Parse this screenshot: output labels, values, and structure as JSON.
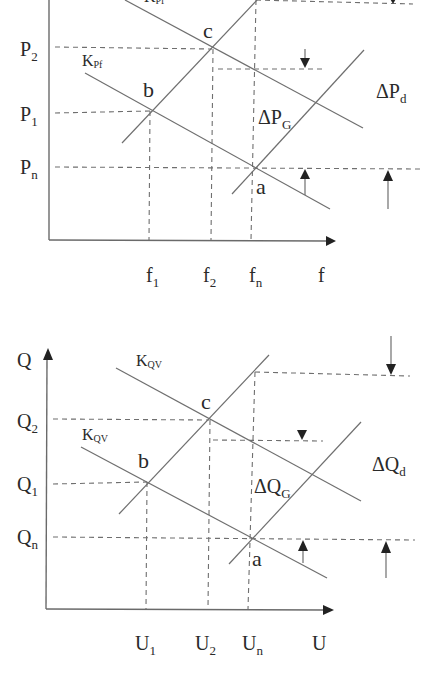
{
  "diagrams": [
    {
      "id": "frequency-power",
      "y_axis": {
        "symbol": "P",
        "ticks": [
          {
            "base": "P",
            "sub": "2"
          },
          {
            "base": "P",
            "sub": "1"
          },
          {
            "base": "P",
            "sub": "n"
          }
        ]
      },
      "x_axis": {
        "symbol": "f",
        "ticks": [
          {
            "base": "f",
            "sub": "1"
          },
          {
            "base": "f",
            "sub": "2"
          },
          {
            "base": "f",
            "sub": "n"
          }
        ]
      },
      "curve_labels": [
        {
          "base": "K",
          "sub": "Pf"
        },
        {
          "base": "K",
          "sub": "Pf"
        }
      ],
      "points": [
        "a",
        "b",
        "c"
      ],
      "delta_labels": [
        {
          "base": "ΔP",
          "sub": "G"
        },
        {
          "base": "ΔP",
          "sub": "d"
        }
      ]
    },
    {
      "id": "voltage-reactive",
      "y_axis": {
        "symbol": "Q",
        "ticks": [
          {
            "base": "Q",
            "sub": "2"
          },
          {
            "base": "Q",
            "sub": "1"
          },
          {
            "base": "Q",
            "sub": "n"
          }
        ]
      },
      "x_axis": {
        "symbol": "U",
        "ticks": [
          {
            "base": "U",
            "sub": "1"
          },
          {
            "base": "U",
            "sub": "2"
          },
          {
            "base": "U",
            "sub": "n"
          }
        ]
      },
      "curve_labels": [
        {
          "base": "K",
          "sub": "QV"
        },
        {
          "base": "K",
          "sub": "QV"
        }
      ],
      "points": [
        "a",
        "b",
        "c"
      ],
      "delta_labels": [
        {
          "base": "ΔQ",
          "sub": "G"
        },
        {
          "base": "ΔQ",
          "sub": "d"
        }
      ]
    }
  ]
}
